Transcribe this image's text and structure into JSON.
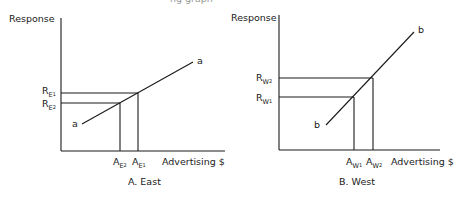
{
  "clipped_top_text": "ng graph",
  "panels": [
    {
      "id": "A",
      "caption": "A. East",
      "y_axis_label": "Response",
      "x_axis_label": "Advertising $",
      "curve_label": "a",
      "r_labels": [
        {
          "base": "R",
          "sub": "E",
          "subsub": "1"
        },
        {
          "base": "R",
          "sub": "E",
          "subsub": "2"
        }
      ],
      "a_labels": [
        {
          "base": "A",
          "sub": "E",
          "subsub": "2"
        },
        {
          "base": "A",
          "sub": "E",
          "subsub": "1"
        }
      ]
    },
    {
      "id": "B",
      "caption": "B. West",
      "y_axis_label": "Response",
      "x_axis_label": "Advertising $",
      "curve_label": "b",
      "r_labels": [
        {
          "base": "R",
          "sub": "W",
          "subsub": "2"
        },
        {
          "base": "R",
          "sub": "W",
          "subsub": "1"
        }
      ],
      "a_labels": [
        {
          "base": "A",
          "sub": "W",
          "subsub": "1"
        },
        {
          "base": "A",
          "sub": "W",
          "subsub": "2"
        }
      ]
    }
  ]
}
